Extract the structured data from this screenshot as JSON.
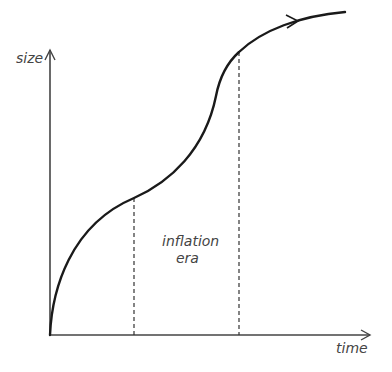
{
  "diagram": {
    "y_axis_label": "size",
    "x_axis_label": "time",
    "region_label_line1": "inflation",
    "region_label_line2": "era",
    "colors": {
      "curve": "#1a1a1a",
      "axis": "#444444",
      "dashed": "#333333",
      "text": "#444444"
    }
  }
}
